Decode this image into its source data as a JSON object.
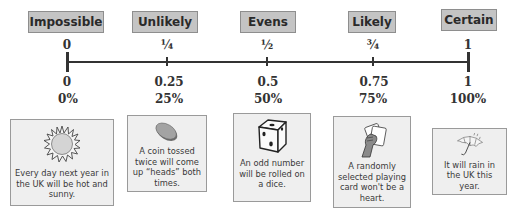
{
  "scale": {
    "labels": [
      {
        "text": "Impossible",
        "x": 28,
        "y": 11,
        "w": 76
      },
      {
        "text": "Unlikely",
        "x": 132,
        "y": 11,
        "w": 66
      },
      {
        "text": "Evens",
        "x": 240,
        "y": 11,
        "w": 56
      },
      {
        "text": "Likely",
        "x": 348,
        "y": 11,
        "w": 48
      },
      {
        "text": "Certain",
        "x": 441,
        "y": 9,
        "w": 56
      }
    ],
    "points": [
      {
        "fraction": "0",
        "decimal": "0",
        "percent": "0%",
        "x": 67
      },
      {
        "fraction": "¼",
        "decimal": "0.25",
        "percent": "25%",
        "x": 167
      },
      {
        "fraction": "½",
        "decimal": "0.5",
        "percent": "50%",
        "x": 267
      },
      {
        "fraction": "¾",
        "decimal": "0.75",
        "percent": "75%",
        "x": 373
      },
      {
        "fraction": "1",
        "decimal": "1",
        "percent": "100%",
        "x": 468
      }
    ]
  },
  "examples": [
    {
      "icon": "sun-icon",
      "text": "Every day next year in the UK will be hot and sunny."
    },
    {
      "icon": "coin-icon",
      "text": "A coin tossed twice will come up “heads” both times."
    },
    {
      "icon": "dice-icon",
      "text": "An odd number will be rolled on a dice."
    },
    {
      "icon": "playing-card-icon",
      "text": "A randomly selected playing card won't be a heart."
    },
    {
      "icon": "umbrella-icon",
      "text": "It will rain in the UK this year."
    }
  ],
  "colors": {
    "label_bg": "#c4c4c4",
    "card_bg": "#efefef",
    "axis": "#333333",
    "sun_fill": "#d9d9d9",
    "coin_fill": "#9a9a9a"
  }
}
